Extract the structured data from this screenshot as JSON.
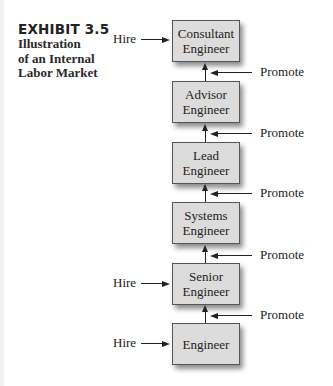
{
  "exhibit": {
    "label": "EXHIBIT 3.5",
    "caption_lines": [
      "Illustration",
      "of an Internal",
      "Labor Market"
    ]
  },
  "ladder": [
    {
      "line1": "Consultant",
      "line2": "Engineer",
      "hire": true
    },
    {
      "line1": "Advisor",
      "line2": "Engineer",
      "hire": false
    },
    {
      "line1": "Lead",
      "line2": "Engineer",
      "hire": false
    },
    {
      "line1": "Systems",
      "line2": "Engineer",
      "hire": false
    },
    {
      "line1": "Senior",
      "line2": "Engineer",
      "hire": true
    },
    {
      "line1": "",
      "line2": "Engineer",
      "hire": true
    }
  ],
  "labels": {
    "hire": "Hire",
    "promote": "Promote"
  },
  "colors": {
    "box_fill": "#dcdcdc",
    "box_border": "#555555",
    "arrow": "#222222"
  }
}
